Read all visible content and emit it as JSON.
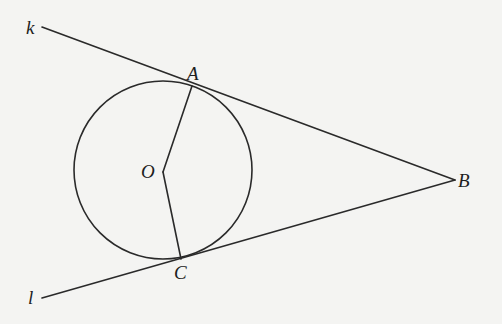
{
  "diagram": {
    "type": "geometry",
    "colors": {
      "background": "#f4f4f2",
      "stroke": "#2a2a2a",
      "text": "#1e1e1e"
    },
    "circle": {
      "center_label": "O",
      "cx": 163,
      "cy": 170,
      "r": 89
    },
    "points": {
      "A": {
        "label": "A",
        "x": 192,
        "y": 86
      },
      "B": {
        "label": "B",
        "x": 455,
        "y": 180
      },
      "C": {
        "label": "C",
        "x": 181,
        "y": 259
      },
      "O": {
        "label": "O",
        "x": 163,
        "y": 172
      }
    },
    "lines": {
      "k": {
        "label": "k",
        "x1": 42,
        "y1": 27,
        "x2": 455,
        "y2": 180
      },
      "l": {
        "label": "l",
        "x1": 42,
        "y1": 298,
        "x2": 455,
        "y2": 180
      }
    },
    "segments": [
      {
        "name": "OA",
        "from": "O",
        "to": "A"
      },
      {
        "name": "OC",
        "from": "O",
        "to": "C"
      }
    ]
  }
}
